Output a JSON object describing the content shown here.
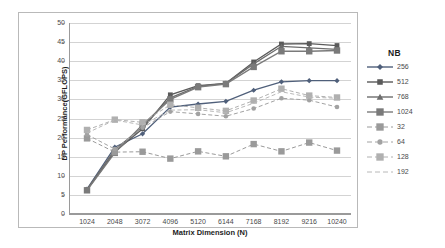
{
  "chart_data": {
    "type": "line",
    "title": "",
    "xlabel": "Matrix Dimension (N)",
    "ylabel": "DP Performance(GFLOPS)",
    "legend_title": "NB",
    "legend_position": "right",
    "grid": true,
    "xlim": [
      1024,
      10240
    ],
    "ylim": [
      0,
      50
    ],
    "ytick_step": 5,
    "yticks": [
      0,
      5,
      10,
      15,
      20,
      25,
      30,
      35,
      40,
      45,
      50
    ],
    "categories": [
      1024,
      2048,
      3072,
      4096,
      5120,
      6144,
      7168,
      8192,
      9216,
      10240
    ],
    "xticks": [
      "1024",
      "2048",
      "3072",
      "4096",
      "5120",
      "6144",
      "7168",
      "8192",
      "9216",
      "10240"
    ],
    "series": [
      {
        "name": "256",
        "marker": "diamond",
        "color": "#4f5f7a",
        "dash": "solid",
        "values": [
          6.5,
          17.5,
          21.0,
          28.0,
          28.8,
          29.5,
          32.4,
          34.6,
          34.9,
          34.9
        ]
      },
      {
        "name": "512",
        "marker": "square",
        "color": "#5a5a5a",
        "dash": "solid",
        "values": [
          6.3,
          16.3,
          22.3,
          31.2,
          33.6,
          34.2,
          39.8,
          44.5,
          44.6,
          44.1
        ]
      },
      {
        "name": "768",
        "marker": "triangle",
        "color": "#6d6d6d",
        "dash": "solid",
        "values": [
          6.4,
          16.8,
          22.8,
          30.4,
          33.4,
          34.2,
          39.3,
          43.9,
          43.5,
          43.1
        ]
      },
      {
        "name": "1024",
        "marker": "square-large",
        "color": "#7a7a7a",
        "dash": "solid",
        "values": [
          6.2,
          16.0,
          23.4,
          30.0,
          33.2,
          34.0,
          38.5,
          42.6,
          42.6,
          42.8
        ]
      },
      {
        "name": "32",
        "marker": "square-large",
        "color": "#9a9a9a",
        "dash": "dashed",
        "values": [
          19.8,
          16.2,
          16.3,
          14.5,
          16.4,
          15.1,
          18.3,
          16.4,
          18.7,
          16.6
        ]
      },
      {
        "name": "64",
        "marker": "circle",
        "color": "#a2a2a2",
        "dash": "dashed",
        "values": [
          20.8,
          17.0,
          22.6,
          26.8,
          26.2,
          25.6,
          27.6,
          30.3,
          29.8,
          28.0
        ]
      },
      {
        "name": "128",
        "marker": "square-large",
        "color": "#b0b0b0",
        "dash": "dashed",
        "values": [
          22.0,
          24.7,
          24.0,
          28.6,
          27.8,
          27.0,
          29.7,
          32.8,
          31.0,
          30.5
        ]
      },
      {
        "name": "192",
        "marker": "none",
        "color": "#b8b8b8",
        "dash": "dashed",
        "values": [
          21.2,
          24.6,
          23.3,
          27.2,
          27.3,
          26.5,
          29.0,
          32.0,
          30.6,
          30.3
        ]
      }
    ]
  }
}
